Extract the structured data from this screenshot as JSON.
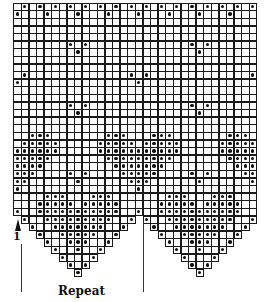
{
  "chart": {
    "type": "knitting-chart",
    "columns": 32,
    "full_rows": 28,
    "total_rows": 36,
    "cell_size": 7.6,
    "origin": {
      "x": 13.4,
      "y": 2.7
    },
    "scallop_bases": [
      0,
      16
    ],
    "scallop_start_row": 27,
    "dot_color": "#111111",
    "grid_color": "#1a1a1a",
    "dots": {
      "0": [
        1,
        3,
        5,
        7,
        9,
        11,
        13,
        15,
        17,
        19,
        21,
        23,
        25,
        27,
        29,
        31
      ],
      "1": [
        0,
        4,
        8,
        12,
        16,
        20,
        24,
        28
      ],
      "5": [
        7,
        9,
        23,
        25
      ],
      "6": [
        8,
        24
      ],
      "9": [
        1,
        15,
        17,
        31
      ],
      "10": [
        0,
        16
      ],
      "13": [
        7,
        9,
        23,
        25
      ],
      "14": [
        8,
        24
      ],
      "17": [
        2,
        3,
        4,
        12,
        13,
        14,
        18,
        19,
        20,
        28,
        29,
        30
      ],
      "18": [
        1,
        2,
        3,
        4,
        5,
        11,
        12,
        13,
        14,
        15,
        17,
        18,
        19,
        20,
        21,
        27,
        28,
        29,
        30,
        31
      ],
      "19": [
        0,
        1,
        2,
        3,
        4,
        5,
        11,
        12,
        13,
        14,
        15,
        16,
        17,
        18,
        19,
        20,
        21,
        27,
        28,
        29,
        30,
        31
      ],
      "20": [
        0,
        1,
        2,
        3,
        4,
        12,
        13,
        14,
        15,
        16,
        17,
        18,
        19,
        20,
        28,
        29,
        30,
        31
      ],
      "21": [
        0,
        1,
        2,
        3,
        13,
        14,
        15,
        16,
        17,
        18,
        19,
        29,
        30,
        31
      ],
      "22": [
        0,
        1,
        2,
        7,
        9,
        14,
        15,
        16,
        17,
        18,
        23,
        25,
        30,
        31
      ],
      "23": [
        0,
        1,
        8,
        15,
        16,
        17,
        24,
        31
      ],
      "24": [
        0,
        16
      ],
      "25": [
        4,
        5,
        6,
        10,
        11,
        12,
        20,
        21,
        22,
        26,
        27,
        28
      ],
      "26": [
        3,
        4,
        5,
        6,
        7,
        9,
        10,
        11,
        12,
        13,
        19,
        20,
        21,
        22,
        23,
        25,
        26,
        27,
        28,
        29
      ],
      "27": [
        0,
        3,
        4,
        5,
        6,
        7,
        8,
        9,
        10,
        11,
        12,
        13,
        16,
        19,
        20,
        21,
        22,
        23,
        24,
        25,
        26,
        27,
        28,
        29
      ],
      "28": [
        1,
        4,
        5,
        6,
        7,
        8,
        9,
        10,
        11,
        12,
        15,
        17,
        20,
        21,
        22,
        23,
        24,
        25,
        26,
        27,
        28,
        31
      ],
      "29": [
        2,
        5,
        6,
        7,
        8,
        9,
        10,
        11,
        14,
        18,
        21,
        22,
        23,
        24,
        25,
        26,
        27,
        30
      ],
      "30": [
        3,
        6,
        7,
        8,
        9,
        10,
        13,
        19,
        22,
        23,
        24,
        25,
        26,
        29
      ],
      "31": [
        4,
        7,
        8,
        9,
        12,
        20,
        23,
        24,
        25,
        28
      ],
      "32": [
        5,
        8,
        11,
        21,
        24,
        27
      ],
      "33": [
        6,
        10,
        22,
        26
      ],
      "34": [
        7,
        9,
        23,
        25
      ],
      "35": [
        8,
        24
      ]
    }
  },
  "labels": {
    "start_row": "1",
    "repeat": "Repeat"
  },
  "markers": {
    "start_arrow": {
      "x": 18,
      "y": 218
    },
    "left_line": {
      "x": 21,
      "y1": 232,
      "y2": 292
    },
    "right_line": {
      "x": 143,
      "y1": 220,
      "y2": 292
    }
  }
}
